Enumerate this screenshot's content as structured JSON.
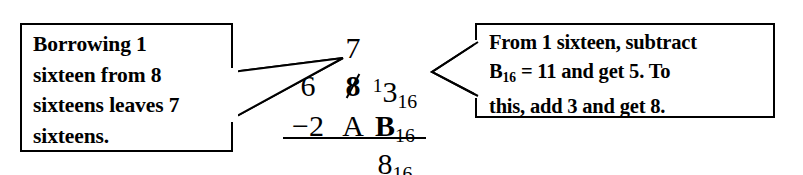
{
  "figure": {
    "kind": "hexadecimal-subtraction-worked-example",
    "background_color": "#ffffff",
    "ink_color": "#000000"
  },
  "callouts": {
    "left": {
      "lines": [
        "Borrowing 1",
        "sixteen from 8",
        "sixteens leaves 7",
        "sixteens."
      ],
      "points_to": "borrow-digit-7"
    },
    "right": {
      "line1": "From 1 sixteen, subtract",
      "line2_prefix": "B",
      "line2_sub": "16",
      "line2_rest": " = 11 and get 5. To",
      "line3": "this, add 3 and get 8.",
      "points_to": "minuend-ones-digit"
    }
  },
  "arithmetic": {
    "borrow_row": {
      "digit": "7"
    },
    "minuend_row": {
      "sixteens_hundreds": "6",
      "crossed_digit": "8",
      "borrow_mark": "1",
      "ones_digit": "3",
      "base_subscript": "16"
    },
    "subtrahend_row": {
      "operator": "−2",
      "middle_digit": "A",
      "ones_digit": "B",
      "base_subscript": "16"
    },
    "answer_row": {
      "digit": "8",
      "base_subscript": "16"
    }
  }
}
